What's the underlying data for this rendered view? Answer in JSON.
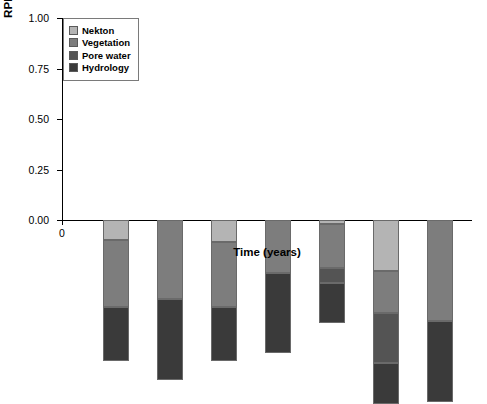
{
  "chart_data": {
    "type": "bar",
    "stacked": true,
    "title": "",
    "xlabel": "Time (years)",
    "ylabel": "RPI Score",
    "categories": [
      "1",
      "2",
      "3",
      "4",
      "5",
      "6",
      "7"
    ],
    "x": [
      1,
      2,
      3,
      4,
      5,
      6,
      7
    ],
    "xlim": [
      0,
      7.6
    ],
    "ylim": [
      0.0,
      1.0
    ],
    "yticks": [
      "0.00",
      "0.25",
      "0.50",
      "0.75",
      "1.00"
    ],
    "ytick_values": [
      0.0,
      0.25,
      0.5,
      0.75,
      1.0
    ],
    "xticks": [
      "0",
      "1",
      "2",
      "3",
      "4",
      "5",
      "6",
      "7"
    ],
    "xtick_values": [
      0,
      1,
      2,
      3,
      4,
      5,
      6,
      7
    ],
    "grid": false,
    "legend_position": "top-left",
    "series": [
      {
        "name": "Hydrology",
        "color": "#3a3a3a",
        "values": [
          0.27,
          0.4,
          0.27,
          0.4,
          0.2,
          0.2,
          0.4
        ]
      },
      {
        "name": "Pore water",
        "color": "#545454",
        "values": [
          0.0,
          0.0,
          0.0,
          0.0,
          0.07,
          0.25,
          0.0
        ]
      },
      {
        "name": "Vegetation",
        "color": "#7d7d7d",
        "values": [
          0.33,
          0.39,
          0.32,
          0.26,
          0.22,
          0.21,
          0.5
        ]
      },
      {
        "name": "Nekton",
        "color": "#b4b4b4",
        "values": [
          0.1,
          0.0,
          0.11,
          0.0,
          0.02,
          0.25,
          0.0
        ]
      }
    ],
    "totals": [
      0.7,
      0.79,
      0.7,
      0.66,
      0.51,
      0.91,
      0.9
    ]
  },
  "legend": {
    "items": [
      {
        "label": "Nekton",
        "color": "#b4b4b4"
      },
      {
        "label": "Vegetation",
        "color": "#7d7d7d"
      },
      {
        "label": "Pore water",
        "color": "#545454"
      },
      {
        "label": "Hydrology",
        "color": "#3a3a3a"
      }
    ]
  }
}
